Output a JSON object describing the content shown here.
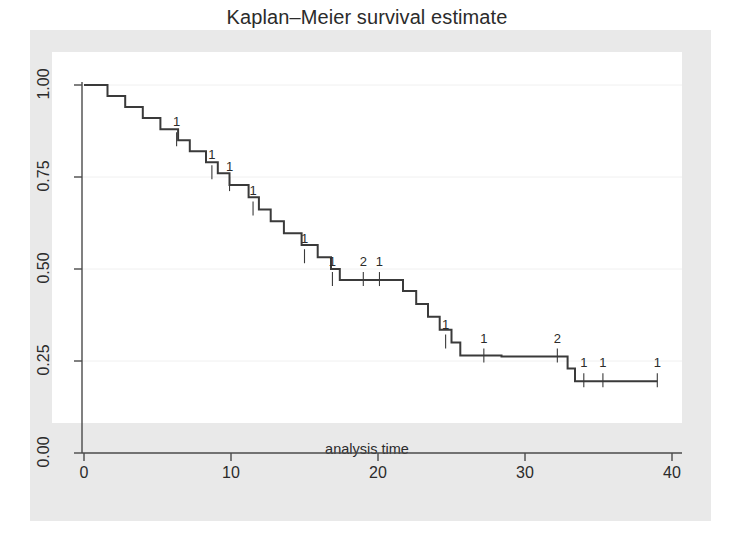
{
  "chart_data": {
    "type": "line",
    "subtype": "kaplan-meier-step",
    "title": "Kaplan–Meier survival estimate",
    "xlabel": "analysis time",
    "ylabel": "",
    "xlim": [
      0,
      40
    ],
    "ylim": [
      0,
      1
    ],
    "xticks": [
      0,
      10,
      20,
      30,
      40
    ],
    "xtick_labels": [
      "0",
      "10",
      "20",
      "30",
      "40"
    ],
    "yticks": [
      0.0,
      0.25,
      0.5,
      0.75,
      1.0
    ],
    "ytick_labels": [
      "0.00",
      "0.25",
      "0.50",
      "0.75",
      "1.00"
    ],
    "grid": "horizontal",
    "gridlines_at": [
      0.25,
      0.5,
      0.75,
      1.0
    ],
    "legend": "none",
    "line_color": "#3a3a3a",
    "background_color": "#e9e9e9",
    "plot_background_color": "#ffffff",
    "grid_color": "#f0f0f0",
    "step_points": [
      [
        0.0,
        1.0
      ],
      [
        1.6,
        0.97
      ],
      [
        2.8,
        0.94
      ],
      [
        4.0,
        0.91
      ],
      [
        5.2,
        0.88
      ],
      [
        6.4,
        0.85
      ],
      [
        7.2,
        0.82
      ],
      [
        8.3,
        0.79
      ],
      [
        9.1,
        0.76
      ],
      [
        9.9,
        0.728
      ],
      [
        11.2,
        0.695
      ],
      [
        11.9,
        0.662
      ],
      [
        12.7,
        0.63
      ],
      [
        13.6,
        0.597
      ],
      [
        14.8,
        0.565
      ],
      [
        15.9,
        0.532
      ],
      [
        16.8,
        0.5
      ],
      [
        17.4,
        0.47
      ],
      [
        21.7,
        0.44
      ],
      [
        22.6,
        0.405
      ],
      [
        23.4,
        0.37
      ],
      [
        24.2,
        0.335
      ],
      [
        25.0,
        0.3
      ],
      [
        25.6,
        0.265
      ],
      [
        28.4,
        0.262
      ],
      [
        32.9,
        0.23
      ],
      [
        33.4,
        0.195
      ],
      [
        39.0,
        0.195
      ]
    ],
    "censor_marks": [
      {
        "time": 6.3,
        "survival": 0.85,
        "count": "1"
      },
      {
        "time": 8.7,
        "survival": 0.76,
        "count": "1"
      },
      {
        "time": 9.9,
        "survival": 0.728,
        "count": "1"
      },
      {
        "time": 11.5,
        "survival": 0.662,
        "count": "1"
      },
      {
        "time": 15.0,
        "survival": 0.532,
        "count": "1"
      },
      {
        "time": 16.9,
        "survival": 0.47,
        "count": "1"
      },
      {
        "time": 19.0,
        "survival": 0.47,
        "count": "2"
      },
      {
        "time": 20.1,
        "survival": 0.47,
        "count": "1"
      },
      {
        "time": 24.6,
        "survival": 0.3,
        "count": "1"
      },
      {
        "time": 27.2,
        "survival": 0.262,
        "count": "1"
      },
      {
        "time": 32.2,
        "survival": 0.262,
        "count": "2"
      },
      {
        "time": 34.0,
        "survival": 0.195,
        "count": "1"
      },
      {
        "time": 35.3,
        "survival": 0.195,
        "count": "1"
      },
      {
        "time": 39.0,
        "survival": 0.195,
        "count": "1"
      }
    ]
  }
}
